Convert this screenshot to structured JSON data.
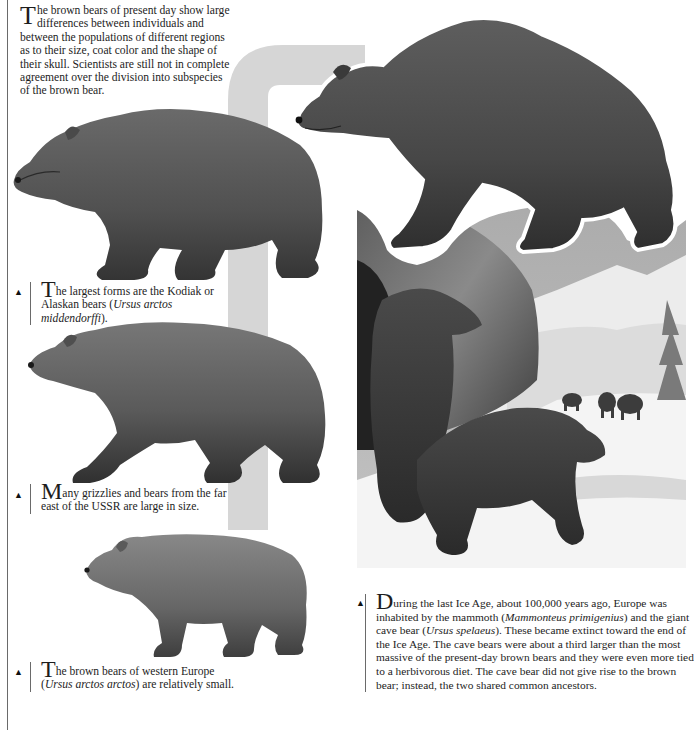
{
  "intro": {
    "dropcap": "T",
    "text": "he brown bears of present day show large differences between individuals and between the populations of different regions as to their size, coat color and the shape of their skull. Scientists are still not in complete agreement over the division into subspecies of the brown bear."
  },
  "captions": [
    {
      "dropcap": "T",
      "before": "he largest forms are the Kodiak or Alaskan bears (",
      "italic": "Ursus arctos middendorffi",
      "after": ")."
    },
    {
      "dropcap": "M",
      "before": "any grizzlies and bears from the far east of the USSR are large in size.",
      "italic": "",
      "after": ""
    },
    {
      "dropcap": "T",
      "before": "he brown bears of western Europe (",
      "italic": "Ursus arctos arctos",
      "after": ") are relatively small."
    }
  ],
  "ice_age": {
    "dropcap": "D",
    "p1": "uring the last Ice Age, about 100,000 years ago, Europe was inhabited by the mammoth (",
    "i1": "Mammonteus primigenius",
    "p2": ") and the giant cave bear (",
    "i2": "Ursus spelaeus",
    "p3": "). These became extinct toward the end of the Ice Age. The cave bears were about a third larger than the most massive of the present-day brown bears and they were even more tied to a herbivorous diet. The cave bear did not give rise to the brown bear; instead, the two shared common ancestors."
  },
  "marker_glyph": "▲",
  "illustrations": [
    {
      "name": "kodiak-bear",
      "description": "Kodiak / Alaskan brown bear, standing, facing left"
    },
    {
      "name": "grizzly-bear",
      "description": "Grizzly bear, walking, facing left"
    },
    {
      "name": "european-brown-bear",
      "description": "Western European brown bear, standing, facing left"
    },
    {
      "name": "cave-bear-large",
      "description": "Giant cave bear walking on rock, cut-out over scene"
    },
    {
      "name": "ice-age-scene",
      "description": "Two cave bears by a rocky cave in snow, mammoths and snowy mountains in background"
    }
  ],
  "colors": {
    "band": "#d6d6d6",
    "fur_dark": "#3a3a3a",
    "fur_mid": "#5c5c5c",
    "fur_light": "#8a8a8a",
    "sky": "#9e9e9e",
    "snow": "#f0f0f0"
  }
}
